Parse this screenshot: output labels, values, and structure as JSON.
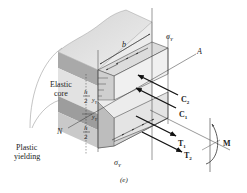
{
  "figure": {
    "caption": "(e)",
    "labels": {
      "elastic_core_line1": "Elastic",
      "elastic_core_line2": "core",
      "plastic_line1": "Plastic",
      "plastic_line2": "yielding",
      "neutral_N": "N",
      "neutral_A": "A",
      "width_b": "b",
      "sigma_top": "σ",
      "sigma_top_sub": "Y",
      "sigma_bottom": "σ",
      "sigma_bottom_sub": "Y",
      "h_top_num": "h",
      "h_top_den": "2",
      "h_bot_num": "h",
      "h_bot_den": "2",
      "y_upper": "y",
      "y_upper_sub": "Y",
      "y_lower": "y",
      "y_lower_sub": "Y",
      "force_C2": "C",
      "force_C2_sub": "2",
      "force_C1": "C",
      "force_C1_sub": "1",
      "force_T1": "T",
      "force_T1_sub": "1",
      "force_T2": "T",
      "force_T2_sub": "2",
      "moment_M": "M"
    },
    "colors": {
      "face_light": "#e6e6e6",
      "face_mid": "#c8c8c8",
      "face_dark": "#9e9e9e",
      "stress_fill": "#d9d9d9",
      "line": "#333333",
      "arrow": "#111111"
    }
  }
}
